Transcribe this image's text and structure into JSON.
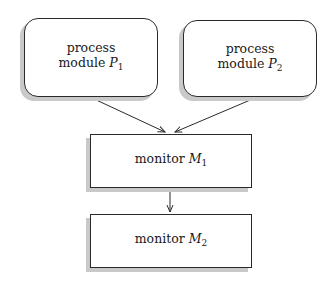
{
  "nodes": [
    {
      "id": "p1",
      "shape": "rounded-rectangle",
      "line1": "process",
      "prefix": "module",
      "symbol": "P",
      "subscript": "1"
    },
    {
      "id": "p2",
      "shape": "rounded-rectangle",
      "line1": "process",
      "prefix": "module",
      "symbol": "P",
      "subscript": "2"
    },
    {
      "id": "m1",
      "shape": "rectangle",
      "prefix": "monitor",
      "symbol": "M",
      "subscript": "1"
    },
    {
      "id": "m2",
      "shape": "rectangle",
      "prefix": "monitor",
      "symbol": "M",
      "subscript": "2"
    }
  ],
  "edges": [
    {
      "from": "p1",
      "to": "m1"
    },
    {
      "from": "p2",
      "to": "m1"
    },
    {
      "from": "m1",
      "to": "m2"
    }
  ],
  "colors": {
    "stroke": "#2a2a2a",
    "shadow": "#c9c9c9",
    "background": "#ffffff"
  }
}
